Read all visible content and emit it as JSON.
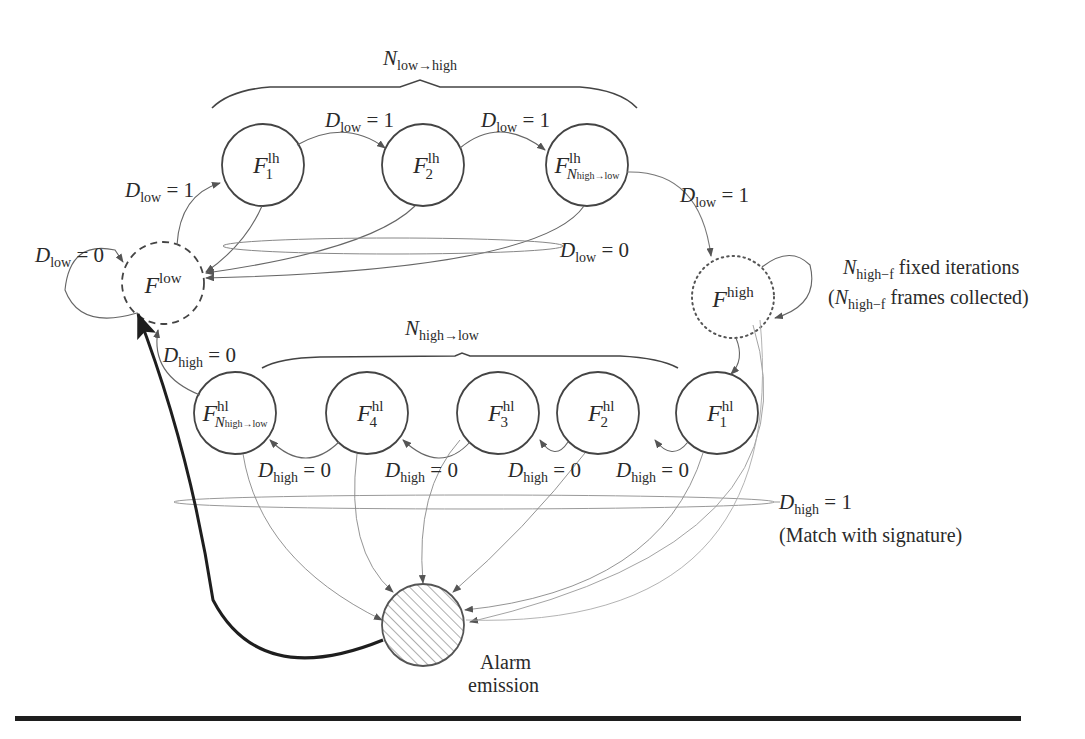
{
  "figure": {
    "braces": {
      "top": {
        "symbol": "N",
        "subscript": "low→high"
      },
      "bottom": {
        "symbol": "N",
        "subscript": "high→low"
      }
    },
    "nodes": [
      {
        "id": "F_low",
        "base": "F",
        "sup": "low",
        "sub": "",
        "style": "dashed"
      },
      {
        "id": "F_1_lh",
        "base": "F",
        "sup": "lh",
        "sub": "1",
        "style": "solid"
      },
      {
        "id": "F_2_lh",
        "base": "F",
        "sup": "lh",
        "sub": "2",
        "style": "solid"
      },
      {
        "id": "F_N_lh",
        "base": "F",
        "sup": "lh",
        "sub": "N",
        "sub_sub": "high→low",
        "style": "solid"
      },
      {
        "id": "F_high",
        "base": "F",
        "sup": "high",
        "sub": "",
        "style": "dotted"
      },
      {
        "id": "F_1_hl",
        "base": "F",
        "sup": "hl",
        "sub": "1",
        "style": "solid"
      },
      {
        "id": "F_2_hl",
        "base": "F",
        "sup": "hl",
        "sub": "2",
        "style": "solid"
      },
      {
        "id": "F_3_hl",
        "base": "F",
        "sup": "hl",
        "sub": "3",
        "style": "solid"
      },
      {
        "id": "F_4_hl",
        "base": "F",
        "sup": "hl",
        "sub": "4",
        "style": "solid"
      },
      {
        "id": "F_N_hl",
        "base": "F",
        "sup": "hl",
        "sub": "N",
        "sub_sub": "high→low",
        "style": "solid"
      },
      {
        "id": "alarm",
        "label": "Alarm emission",
        "line1": "Alarm",
        "line2": "emission",
        "style": "hatched"
      }
    ],
    "edge_labels": {
      "low_self": {
        "var": "D",
        "sub": "low",
        "eq": "= 0"
      },
      "low_to_1": {
        "var": "D",
        "sub": "low",
        "eq": "= 1"
      },
      "lh_1_to_2": {
        "var": "D",
        "sub": "low",
        "eq": "= 1"
      },
      "lh_2_to_N": {
        "var": "D",
        "sub": "low",
        "eq": "= 1"
      },
      "lh_N_to_high": {
        "var": "D",
        "sub": "low",
        "eq": "= 1"
      },
      "lh_back_to_low": {
        "var": "D",
        "sub": "low",
        "eq": "= 0"
      },
      "hl_N_to_low": {
        "var": "D",
        "sub": "high",
        "eq": "= 0"
      },
      "hl_4_to_N": {
        "var": "D",
        "sub": "high",
        "eq": "= 0"
      },
      "hl_3_to_4": {
        "var": "D",
        "sub": "high",
        "eq": "= 0"
      },
      "hl_2_to_3": {
        "var": "D",
        "sub": "high",
        "eq": "= 0"
      },
      "hl_1_to_2": {
        "var": "D",
        "sub": "high",
        "eq": "= 0"
      },
      "hl_to_alarm": {
        "var": "D",
        "sub": "high",
        "eq": "= 1",
        "note": "(Match with signature)"
      }
    },
    "high_self_note": {
      "line1_var": "N",
      "line1_sub": "high−f",
      "line1_text": " fixed iterations",
      "line2_open": "(",
      "line2_var": "N",
      "line2_sub": "high−f",
      "line2_text": " frames collected)"
    }
  }
}
